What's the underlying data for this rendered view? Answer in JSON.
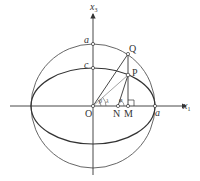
{
  "diagram": {
    "type": "geometry",
    "axes": {
      "horizontal": {
        "name": "x",
        "subscript": "1"
      },
      "vertical": {
        "name": "x",
        "subscript": "3"
      }
    },
    "points": {
      "O": "O",
      "N": "N",
      "M": "M",
      "P": "P",
      "Q": "Q"
    },
    "labels": {
      "a_top": "a",
      "a_right": "a",
      "c_top": "c"
    },
    "angles": {
      "reduced": "β",
      "geocentric": "λ",
      "geodetic": "φ",
      "right_angle_at": "M"
    },
    "segments": [
      "OQ",
      "OP",
      "NP",
      "QM"
    ],
    "colors": {
      "stroke": "#3a3a3a",
      "light_stroke": "#9a9a9a",
      "background": "#ffffff"
    }
  }
}
